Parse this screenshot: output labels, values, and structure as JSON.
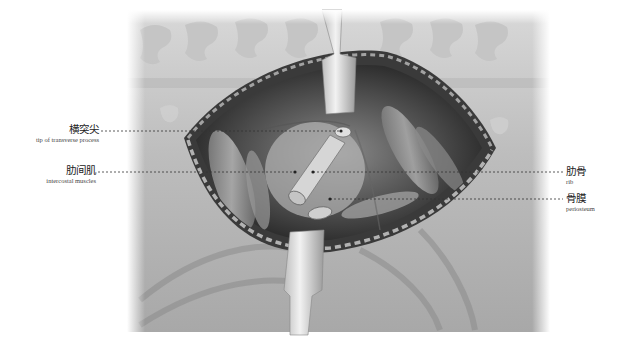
{
  "figure": {
    "colors": {
      "background": "#ffffff",
      "tissue_dark": "#2a2a2a",
      "tissue_mid": "#7a7a7a",
      "tissue_light": "#cfcfcf",
      "retractor": "#e6e6e6",
      "leader_line": "#333333"
    }
  },
  "labels": [
    {
      "id": "transverse-process",
      "zh": "横突尖",
      "en": "tip of transverse process",
      "side": "left"
    },
    {
      "id": "intercostal-muscles",
      "zh": "肋间肌",
      "en": "intercostal muscles",
      "side": "left"
    },
    {
      "id": "rib",
      "zh": "肋骨",
      "en": "rib",
      "side": "right"
    },
    {
      "id": "periosteum",
      "zh": "骨膜",
      "en": "periosteum",
      "side": "right"
    }
  ]
}
